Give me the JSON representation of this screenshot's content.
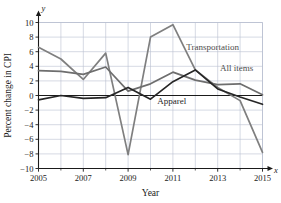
{
  "chart_data": {
    "type": "line",
    "title": "",
    "xlabel": "Year",
    "ylabel": "Percent change in CPI",
    "x_axis_letter": "x",
    "y_axis_letter": "y",
    "x": [
      2005,
      2006,
      2007,
      2008,
      2009,
      2010,
      2011,
      2012,
      2013,
      2014,
      2015
    ],
    "xlim": [
      2005,
      2015
    ],
    "ylim": [
      -10,
      10
    ],
    "xticks": [
      2005,
      2007,
      2009,
      2011,
      2013,
      2015
    ],
    "xtick_labels": [
      "2005",
      "2007",
      "2009",
      "2011",
      "2013",
      "2015"
    ],
    "x_minor_ticks": [
      2006,
      2008,
      2010,
      2012,
      2014
    ],
    "yticks": [
      -10,
      -8,
      -6,
      -4,
      -2,
      0,
      2,
      4,
      6,
      8,
      10
    ],
    "ytick_labels": [
      "−10",
      "−8",
      "−6",
      "−4",
      "−2",
      "0",
      "2",
      "4",
      "6",
      "8",
      "10"
    ],
    "grid": true,
    "legend": "inline-labels",
    "series": [
      {
        "name": "Transportation",
        "color": "#7f7f7f",
        "label_x": 2011.6,
        "label_y": 6.2,
        "values": [
          6.6,
          5.0,
          2.2,
          5.8,
          -8.1,
          8.0,
          9.7,
          3.5,
          1.1,
          -0.7,
          -7.8
        ]
      },
      {
        "name": "All items",
        "color": "#6e6e6e",
        "label_x": 2013.1,
        "label_y": 3.3,
        "values": [
          3.4,
          3.3,
          2.9,
          3.9,
          0.6,
          1.6,
          3.2,
          2.1,
          1.5,
          1.6,
          0.1
        ]
      },
      {
        "name": "Apparel",
        "color": "#262626",
        "label_x": 2010.3,
        "label_y": -1.1,
        "values": [
          -0.6,
          0.0,
          -0.4,
          -0.3,
          1.1,
          -0.5,
          1.9,
          3.5,
          0.9,
          -0.2,
          -1.2
        ]
      }
    ]
  },
  "colors": {
    "grid": "#b8bfd0",
    "axis": "#1a1a1a",
    "zero_line": "#1a1a1a",
    "background": "#ffffff"
  }
}
